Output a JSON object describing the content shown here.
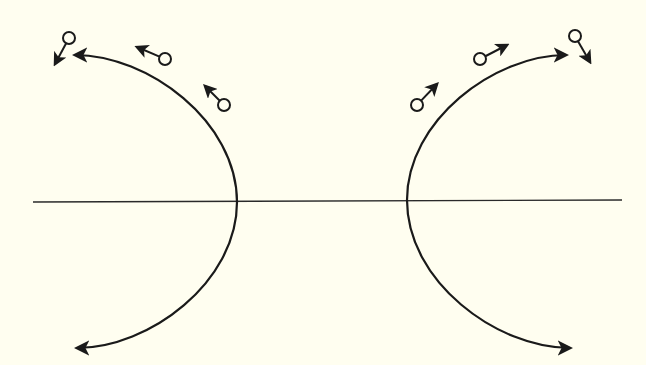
{
  "diagram": {
    "colors": {
      "background": "#fffef0",
      "stroke": "#1a1a1a"
    },
    "axis": {
      "x1": 33,
      "y1": 202,
      "x2": 622,
      "y2": 200
    },
    "curves": [
      {
        "name": "left-trajectory",
        "top_tip": [
          75,
          55
        ],
        "vertex": [
          237,
          202
        ],
        "bottom_tip": [
          77,
          348
        ]
      },
      {
        "name": "right-trajectory",
        "top_tip": [
          566,
          55
        ],
        "vertex": [
          407,
          200
        ],
        "bottom_tip": [
          570,
          348
        ]
      }
    ],
    "particles": [
      {
        "name": "particle-left-outer",
        "circle": [
          69,
          38
        ],
        "arrow_to": [
          55,
          64
        ]
      },
      {
        "name": "particle-left-middle",
        "circle": [
          165,
          59
        ],
        "arrow_to": [
          137,
          47
        ]
      },
      {
        "name": "particle-left-inner",
        "circle": [
          224,
          105
        ],
        "arrow_to": [
          205,
          86
        ]
      },
      {
        "name": "particle-right-inner",
        "circle": [
          417,
          105
        ],
        "arrow_to": [
          437,
          84
        ]
      },
      {
        "name": "particle-right-middle",
        "circle": [
          480,
          59
        ],
        "arrow_to": [
          507,
          45
        ]
      },
      {
        "name": "particle-right-outer",
        "circle": [
          575,
          36
        ],
        "arrow_to": [
          590,
          62
        ]
      }
    ]
  }
}
